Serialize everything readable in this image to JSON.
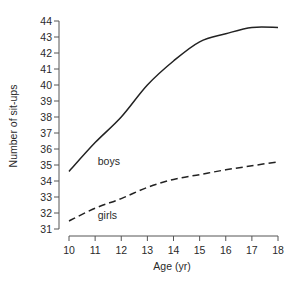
{
  "chart_data": {
    "type": "line",
    "title": "",
    "xlabel": "Age (yr)",
    "ylabel": "Number of sit-ups",
    "xlim": [
      10,
      18
    ],
    "ylim": [
      31,
      44
    ],
    "x": [
      10,
      11,
      12,
      13,
      14,
      15,
      16,
      17,
      18
    ],
    "xticks": [
      "10",
      "11",
      "12",
      "13",
      "14",
      "15",
      "16",
      "17",
      "18"
    ],
    "yticks": [
      "31",
      "32",
      "33",
      "34",
      "35",
      "36",
      "37",
      "38",
      "39",
      "40",
      "41",
      "42",
      "43",
      "44"
    ],
    "grid": false,
    "legend": "none",
    "series": [
      {
        "name": "boys",
        "style": "solid",
        "values": [
          34.6,
          36.4,
          38.0,
          40.0,
          41.5,
          42.7,
          43.2,
          43.6,
          43.6
        ]
      },
      {
        "name": "girls",
        "style": "dashed",
        "values": [
          31.5,
          32.3,
          32.9,
          33.6,
          34.1,
          34.4,
          34.7,
          34.95,
          35.2
        ]
      }
    ],
    "annotations": [
      {
        "text": "boys",
        "x": 11.1,
        "y": 35.0
      },
      {
        "text": "girls",
        "x": 11.1,
        "y": 31.6
      }
    ]
  }
}
